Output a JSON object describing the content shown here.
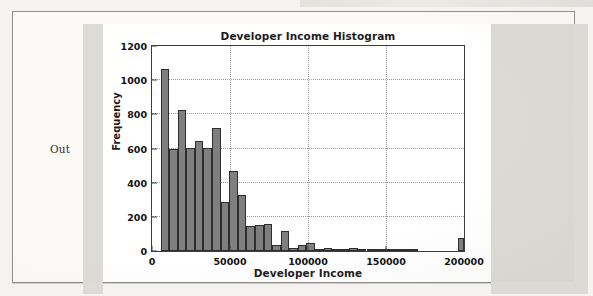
{
  "notebook": {
    "prompt_label": "Out"
  },
  "chart_data": {
    "type": "bar",
    "title": "Developer Income Histogram",
    "xlabel": "Developer Income",
    "ylabel": "Frequency",
    "xlim": [
      0,
      200000
    ],
    "ylim": [
      0,
      1200
    ],
    "xticks": [
      0,
      50000,
      100000,
      150000,
      200000
    ],
    "xtick_labels": [
      "0",
      "50000",
      "100000",
      "150000",
      "200000"
    ],
    "yticks": [
      0,
      200,
      400,
      600,
      800,
      1000,
      1200
    ],
    "ytick_labels": [
      "0",
      "200",
      "400",
      "600",
      "800",
      "1000",
      "1200"
    ],
    "grid": true,
    "grid_style": "dotted",
    "legend": "none",
    "bar_color": "#7f7f7f",
    "bar_edge_color": "#2e2e2e",
    "bin_width": 5500,
    "bin_starts": [
      5500,
      11000,
      16500,
      22000,
      27500,
      33000,
      38500,
      44000,
      49500,
      55000,
      60500,
      66000,
      71500,
      77000,
      82500,
      88000,
      93500,
      99000,
      104500,
      110000,
      115500,
      121000,
      126500,
      132000,
      137500,
      143000,
      148500,
      154000,
      159500,
      165000,
      170500,
      176000,
      181500,
      187000,
      192500,
      196000
    ],
    "values": [
      1065,
      598,
      823,
      603,
      645,
      601,
      720,
      288,
      468,
      327,
      146,
      152,
      158,
      38,
      117,
      18,
      35,
      45,
      10,
      20,
      8,
      5,
      18,
      6,
      2,
      2,
      8,
      2,
      1,
      1,
      0,
      0,
      0,
      0,
      0,
      78
    ]
  }
}
